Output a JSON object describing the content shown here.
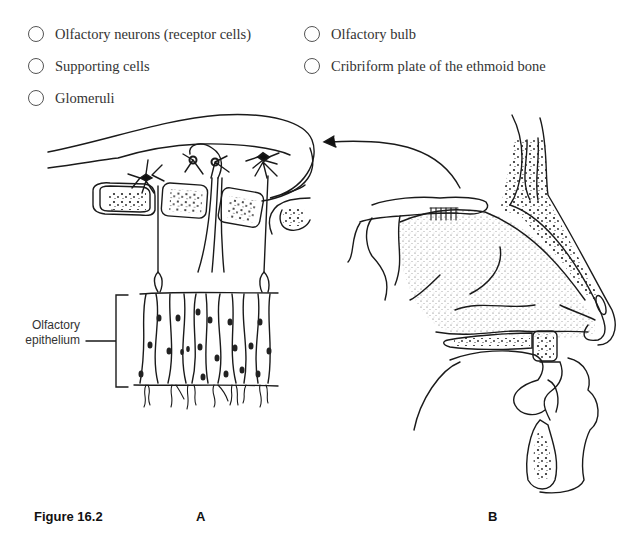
{
  "question": {
    "truncated_header_text": "",
    "options": [
      {
        "id": "olfactory-neurons",
        "label": "Olfactory neurons (receptor cells)",
        "selected": false
      },
      {
        "id": "olfactory-bulb",
        "label": "Olfactory bulb",
        "selected": false
      },
      {
        "id": "supporting-cells",
        "label": "Supporting cells",
        "selected": false
      },
      {
        "id": "cribriform-plate",
        "label": "Cribriform plate of the ethmoid bone",
        "selected": false
      },
      {
        "id": "glomeruli",
        "label": "Glomeruli",
        "selected": false
      }
    ]
  },
  "figure": {
    "caption": "Figure 16.2",
    "panel_a_label": "A",
    "panel_b_label": "B",
    "annotations": {
      "epithelium_line1": "Olfactory",
      "epithelium_line2": "epithelium"
    },
    "colors": {
      "stroke": "#1a1a1a",
      "radio_border": "#555555"
    }
  }
}
